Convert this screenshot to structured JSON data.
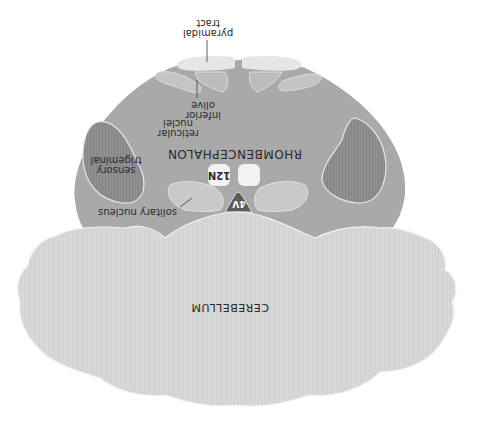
{
  "diagram": {
    "orientation": "rotated-180",
    "colors": {
      "background": "#ffffff",
      "brainstem": "#a9a9a9",
      "sensory_trigeminal": "#8e8e8e",
      "pyramidal_tract": "#e6e6e6",
      "inferior_olive": "#c4c4c4",
      "solitary_region": "#c9c9c9",
      "nucleus_12n": "#f2f2f2",
      "fourth_ventricle": "#5c5c5c",
      "cerebellum": "#d8d8d8",
      "outline": "#eeeeee",
      "text": "#2a2a2a"
    },
    "labels": {
      "pyramidal_tract": "pyramidal\ntract",
      "inferior_olive": "inferior\nolive",
      "reticular_nuclei": "reticular\nnuclei",
      "rhombencephalon": "RHOMBENCEPHALON",
      "nucleus_12n": "12N",
      "sensory_trigeminal": "sensory\ntrigeminal",
      "fourth_ventricle": "4V",
      "solitary_nucleus": "solitary nucleus",
      "cerebellum": "CEREBELLUM"
    }
  }
}
